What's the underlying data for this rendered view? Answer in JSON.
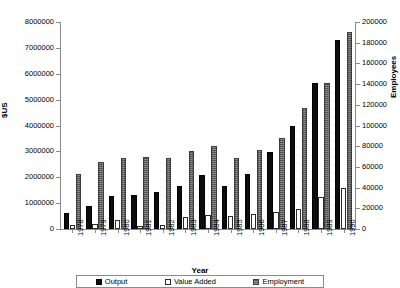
{
  "chart_data": {
    "type": "bar",
    "title": "",
    "subtitle": "",
    "xlabel": "Year",
    "ylabel": "$US",
    "y2label": "Employees",
    "categories": [
      "1978",
      "1979",
      "1980",
      "1981",
      "1982",
      "1983",
      "1984",
      "1985",
      "1986",
      "1987",
      "1988",
      "1989",
      "1990"
    ],
    "ylim": [
      0,
      8000000
    ],
    "y2lim": [
      0,
      200000
    ],
    "ytick_labels": [
      "0",
      "1000000",
      "2000000",
      "3000000",
      "4000000",
      "5000000",
      "6000000",
      "7000000",
      "8000000"
    ],
    "ytick_values": [
      0,
      1000000,
      2000000,
      3000000,
      4000000,
      5000000,
      6000000,
      7000000,
      8000000
    ],
    "y2tick_labels": [
      "0",
      "20000",
      "40000",
      "60000",
      "80000",
      "100000",
      "120000",
      "140000",
      "160000",
      "180000",
      "200000"
    ],
    "y2tick_values": [
      0,
      20000,
      40000,
      60000,
      80000,
      100000,
      120000,
      140000,
      160000,
      180000,
      200000
    ],
    "grid": false,
    "legend_position": "bottom",
    "series": [
      {
        "name": "Output",
        "axis": "left",
        "color": "#0d0d0d",
        "values": [
          630000,
          900000,
          1260000,
          1330000,
          1430000,
          1680000,
          2100000,
          1670000,
          2120000,
          2980000,
          3970000,
          5650000,
          7300000
        ]
      },
      {
        "name": "Value Added",
        "axis": "left",
        "color": "#ffffff",
        "values": [
          150000,
          180000,
          330000,
          120000,
          140000,
          480000,
          550000,
          500000,
          570000,
          670000,
          780000,
          1220000,
          1580000
        ]
      },
      {
        "name": "Employment",
        "axis": "right",
        "color": "#5e5e5e",
        "values": [
          53000,
          65000,
          69000,
          69500,
          69000,
          75000,
          80000,
          69000,
          76000,
          88000,
          117000,
          141000,
          190000
        ]
      }
    ]
  }
}
